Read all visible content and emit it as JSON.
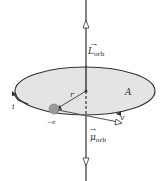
{
  "diagram": {
    "labels": {
      "L_orb": {
        "symbol": "L",
        "subscript": "orb"
      },
      "mu_orb": {
        "symbol": "μ",
        "subscript": "orb"
      },
      "area": "A",
      "radius": "r",
      "current": "i",
      "charge": "−e",
      "velocity": "v"
    },
    "colors": {
      "disk_fill": "#e4e4e4",
      "line": "#333333",
      "electron": "#9a9a9a"
    }
  }
}
